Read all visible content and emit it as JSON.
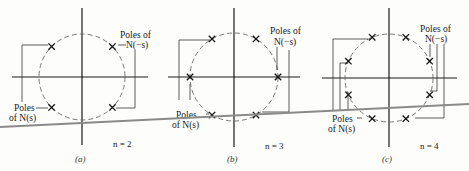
{
  "figure": {
    "panels": [
      {
        "id": "a",
        "caption": "(a)",
        "n_label": "n = 2",
        "n": 2,
        "label_ns_line1": "Poles",
        "label_ns_line2": "of N(s)",
        "label_nms_line1": "Poles of",
        "label_nms_line2": "N(−s)",
        "pole_angles_deg": [
          45,
          135,
          225,
          315
        ]
      },
      {
        "id": "b",
        "caption": "(b)",
        "n_label": "n = 3",
        "n": 3,
        "label_ns_line1": "Poles",
        "label_ns_line2": "of N(s)",
        "label_nms_line1": "Poles of",
        "label_nms_line2": "N(−s)",
        "pole_angles_deg": [
          0,
          60,
          120,
          180,
          240,
          300
        ]
      },
      {
        "id": "c",
        "caption": "(c)",
        "n_label": "n = 4",
        "n": 4,
        "label_ns_line1": "Poles",
        "label_ns_line2": "of N(s)",
        "label_nms_line1": "Poles of",
        "label_nms_line2": "N(−s)",
        "pole_angles_deg": [
          22.5,
          67.5,
          112.5,
          157.5,
          202.5,
          247.5,
          292.5,
          337.5
        ]
      }
    ],
    "colors": {
      "axis": "#1a1a1a",
      "circle": "#6a6a6a",
      "fold_line": "#8a8a8a"
    }
  }
}
